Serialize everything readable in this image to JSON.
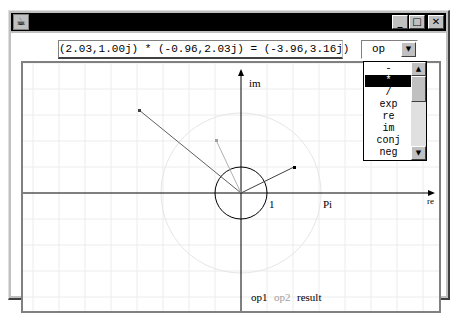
{
  "window": {
    "title": "",
    "controls": {
      "minimize": "_",
      "maximize": "□",
      "close": "✕"
    },
    "app_icon": "java-coffee-cup-icon"
  },
  "toolbar": {
    "expression": "(2.03,1.00j) * (-0.96,2.03j) = (-3.96,3.16j)",
    "operator_select": {
      "value": "op",
      "arrow": "▼"
    }
  },
  "dropdown": {
    "items": [
      "-",
      "*",
      "/",
      "exp",
      "re",
      "im",
      "conj",
      "neg"
    ],
    "selected_index": 1,
    "scroll_up": "▲",
    "scroll_down": "▼"
  },
  "plot": {
    "axis_x_label": "re",
    "axis_y_label": "im",
    "unit_label": "1",
    "pi_label": "Pi",
    "origin_px": [
      230,
      180
    ],
    "unit_px": 26,
    "points": {
      "op1": {
        "re": 2.03,
        "im": 1.0,
        "color": "#404040"
      },
      "op2": {
        "re": -0.96,
        "im": 2.03,
        "color": "#a0a0a0"
      },
      "result": {
        "re": -3.96,
        "im": 3.16,
        "color": "#606060"
      }
    },
    "grid_color": "#eeeeee",
    "axis_color": "#000000"
  },
  "legend": {
    "op1": "op1",
    "op2": "op2",
    "result": "result",
    "op1_color": "#000000",
    "op2_color": "#a0a0a0",
    "result_color": "#000000"
  }
}
